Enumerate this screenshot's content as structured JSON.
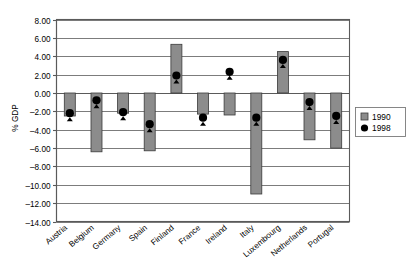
{
  "chart_data": {
    "type": "bar",
    "title": "",
    "xlabel": "",
    "ylabel": "% GDP",
    "ylim": [
      -14.0,
      8.0
    ],
    "ytick_step": 2.0,
    "grid": true,
    "legend_position": "right",
    "categories": [
      "Austria",
      "Belgium",
      "Germany",
      "Spain",
      "Finland",
      "France",
      "Ireland",
      "Italy",
      "Luxembourg",
      "Netherlands",
      "Portugal"
    ],
    "series": [
      {
        "name": "1990",
        "render": "bar",
        "color": "#8c8c8c",
        "values": [
          -2.5,
          -6.4,
          -2.2,
          -6.3,
          5.3,
          -2.3,
          -2.4,
          -11.0,
          4.5,
          -5.1,
          -6.0
        ]
      },
      {
        "name": "1998",
        "render": "marker",
        "color": "#000000",
        "values": [
          -2.2,
          -0.8,
          -2.1,
          -3.4,
          1.9,
          -2.7,
          2.3,
          -2.7,
          3.6,
          -1.0,
          -2.5
        ]
      }
    ],
    "ytick_labels": [
      "8.00",
      "6.00",
      "4.00",
      "2.00",
      "0.00",
      "-2.00",
      "-4.00",
      "-6.00",
      "-8.00",
      "-10.00",
      "-12.00",
      "-14.00"
    ],
    "ytick_values": [
      8,
      6,
      4,
      2,
      0,
      -2,
      -4,
      -6,
      -8,
      -10,
      -12,
      -14
    ]
  },
  "legend": {
    "items": [
      {
        "label": "1990",
        "marker": "square-icon"
      },
      {
        "label": "1998",
        "marker": "circle-icon"
      }
    ]
  }
}
